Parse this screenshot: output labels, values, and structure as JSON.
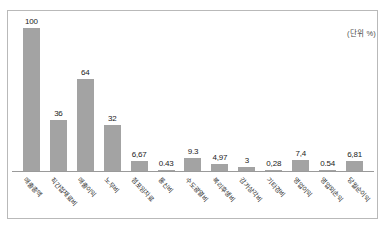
{
  "annotation": {
    "unit_note": "(단위 %)"
  },
  "chart_data": {
    "type": "bar",
    "title": "",
    "subtitle": "",
    "xlabel": "",
    "ylabel": "",
    "unit": "%",
    "unit_note": "(단위 %)",
    "grid": false,
    "legend": "none",
    "ylim": [
      0,
      100
    ],
    "categories": [
      "매출총액",
      "직간접재료비",
      "매출이익",
      "노무비",
      "점포임차료",
      "통신비",
      "수도광열비",
      "복리후생비",
      "감가상각비",
      "기타경비",
      "영업이익",
      "영업외손익",
      "당월순이익"
    ],
    "values": [
      100,
      36,
      64,
      32,
      6.67,
      0.43,
      9.3,
      4.97,
      3,
      0.28,
      7.4,
      0.54,
      6.81
    ],
    "value_labels": [
      "100",
      "36",
      "64",
      "32",
      "6,67",
      "0.43",
      "9.3",
      "4,97",
      "3",
      "0,28",
      "7,4",
      "0.54",
      "6,81"
    ],
    "bar_color": "#a3a3a3",
    "axis_color": "#9a9a9a",
    "frame_color": "#b9b9b9",
    "text_color": "#1b1b1b"
  }
}
